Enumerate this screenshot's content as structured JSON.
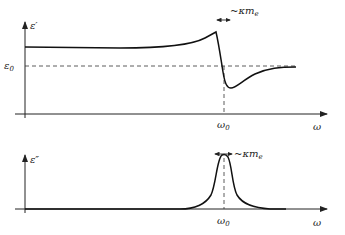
{
  "figure": {
    "top_panel": {
      "ylabel": "ε′",
      "reference_label": "ε",
      "reference_sub": "0",
      "x0_label": "ω",
      "x0_sub": "0",
      "xlabel": "ω",
      "width_label": "~κm",
      "width_sub": "e"
    },
    "bottom_panel": {
      "ylabel": "ε″",
      "x0_label": "ω",
      "x0_sub": "0",
      "xlabel": "ω",
      "width_label": "~κm",
      "width_sub": "e"
    }
  },
  "colors": {
    "curve": "#111111",
    "axis": "#222222",
    "dashed": "#333333"
  }
}
